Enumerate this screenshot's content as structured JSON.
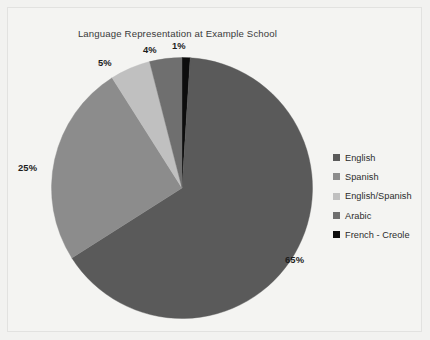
{
  "canvas": {
    "width": 430,
    "height": 340,
    "background": "#f2f2f0",
    "border_color": "#e2e2e0"
  },
  "chart_data": {
    "type": "pie",
    "title": "Language Representation at Example School",
    "xlabel": "",
    "ylabel": "",
    "categories": [
      "English",
      "Spanish",
      "English/Spanish",
      "Arabic",
      "French - Creole"
    ],
    "values": [
      65,
      25,
      5,
      4,
      1
    ],
    "value_labels": [
      "65%",
      "25%",
      "5%",
      "4%",
      "1%"
    ],
    "unit": "%",
    "total": 100,
    "colors": [
      "#5a5a5a",
      "#8c8c8c",
      "#c0c0c0",
      "#6f6f6f",
      "#0d0d0d"
    ],
    "legend_position": "right",
    "grid": false,
    "start_angle_deg": 0,
    "direction": "clockwise",
    "slices": [
      {
        "name": "French - Creole",
        "value": 1,
        "label": "1%",
        "color": "#0d0d0d",
        "start_deg": 0,
        "end_deg": 3.6
      },
      {
        "name": "English",
        "value": 65,
        "label": "65%",
        "color": "#5a5a5a",
        "start_deg": 3.6,
        "end_deg": 237.6
      },
      {
        "name": "Spanish",
        "value": 25,
        "label": "25%",
        "color": "#8c8c8c",
        "start_deg": 237.6,
        "end_deg": 327.6
      },
      {
        "name": "English/Spanish",
        "value": 5,
        "label": "5%",
        "color": "#c0c0c0",
        "start_deg": 327.6,
        "end_deg": 345.6
      },
      {
        "name": "Arabic",
        "value": 4,
        "label": "4%",
        "color": "#6f6f6f",
        "start_deg": 345.6,
        "end_deg": 360
      }
    ]
  },
  "legend": {
    "items": [
      {
        "label": "English",
        "color": "#5a5a5a"
      },
      {
        "label": "Spanish",
        "color": "#8c8c8c"
      },
      {
        "label": "English/Spanish",
        "color": "#c0c0c0"
      },
      {
        "label": "Arabic",
        "color": "#6f6f6f"
      },
      {
        "label": "French - Creole",
        "color": "#0d0d0d"
      }
    ]
  }
}
